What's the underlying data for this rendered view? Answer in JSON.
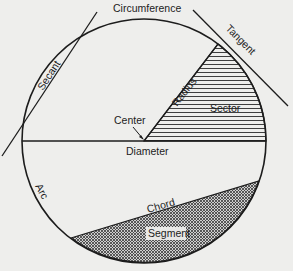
{
  "diagram": {
    "type": "circle-parts",
    "labels": {
      "circumference": "Circumference",
      "tangent": "Tangent",
      "secant": "Secant",
      "radius": "Radius",
      "sector": "Sector",
      "center": "Center",
      "diameter": "Diameter",
      "arc": "Arc",
      "chord": "Chord",
      "segment": "Segment"
    },
    "colors": {
      "background": "#eeeeec",
      "stroke": "#1c1c1c",
      "hatch": "#2a2a2a"
    }
  }
}
